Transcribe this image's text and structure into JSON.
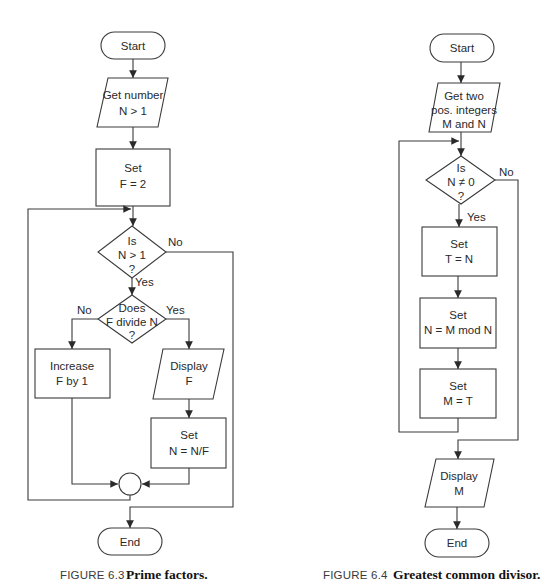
{
  "figures": [
    {
      "id": "fig63",
      "caption": {
        "number": "FIGURE 6.3",
        "title": "Prime factors."
      },
      "nodes": {
        "start": {
          "type": "terminator",
          "label": "Start"
        },
        "input": {
          "type": "io",
          "lines": [
            "Get number",
            "N > 1"
          ]
        },
        "init": {
          "type": "process",
          "lines": [
            "Set",
            "F = 2"
          ]
        },
        "cond1": {
          "type": "decision",
          "lines": [
            "Is",
            "N > 1",
            "?"
          ]
        },
        "cond2": {
          "type": "decision",
          "lines": [
            "Does",
            "F divide N",
            "?"
          ]
        },
        "increase": {
          "type": "process",
          "lines": [
            "Increase",
            "F by 1"
          ]
        },
        "display": {
          "type": "io",
          "lines": [
            "Display",
            "F"
          ]
        },
        "divide": {
          "type": "process",
          "lines": [
            "Set",
            "N = N/F"
          ]
        },
        "join": {
          "type": "connector"
        },
        "end": {
          "type": "terminator",
          "label": "End"
        }
      },
      "edge_labels": {
        "cond1_no": "No",
        "cond1_yes": "Yes",
        "cond2_no": "No",
        "cond2_yes": "Yes"
      }
    },
    {
      "id": "fig64",
      "caption": {
        "number": "FIGURE 6.4",
        "title": "Greatest common divisor."
      },
      "nodes": {
        "start": {
          "type": "terminator",
          "label": "Start"
        },
        "input": {
          "type": "io",
          "lines": [
            "Get two",
            "pos. integers",
            "M and N"
          ]
        },
        "cond": {
          "type": "decision",
          "lines": [
            "Is",
            "N ≠ 0",
            "?"
          ]
        },
        "setT": {
          "type": "process",
          "lines": [
            "Set",
            "T = N"
          ]
        },
        "setN": {
          "type": "process",
          "lines": [
            "Set",
            "N = M mod N"
          ]
        },
        "setM": {
          "type": "process",
          "lines": [
            "Set",
            "M = T"
          ]
        },
        "display": {
          "type": "io",
          "lines": [
            "Display",
            "M"
          ]
        },
        "end": {
          "type": "terminator",
          "label": "End"
        }
      },
      "edge_labels": {
        "cond_no": "No",
        "cond_yes": "Yes"
      }
    }
  ],
  "colors": {
    "stroke": "#3a3a3a",
    "text": "#2a2a2a",
    "background": "#ffffff"
  }
}
